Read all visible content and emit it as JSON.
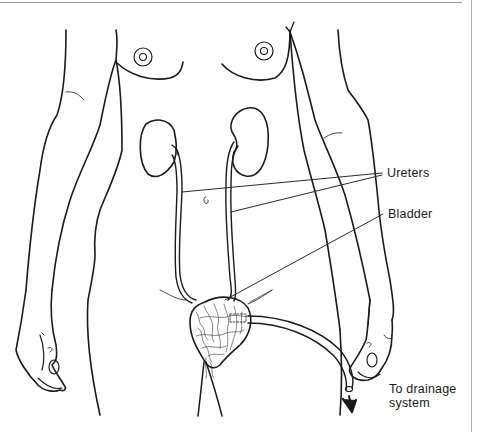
{
  "diagram": {
    "labels": {
      "ureters": "Ureters",
      "bladder": "Bladder",
      "drainage_line1": "To drainage",
      "drainage_line2": "system"
    },
    "colors": {
      "line": "#1a1a1a",
      "leader": "#2a2a2a",
      "background": "#ffffff",
      "border": "#9a9a9a"
    },
    "parts": [
      "breasts",
      "kidneys",
      "ureters",
      "bladder",
      "catheter",
      "drainage-tube",
      "arms",
      "hands",
      "legs"
    ]
  }
}
